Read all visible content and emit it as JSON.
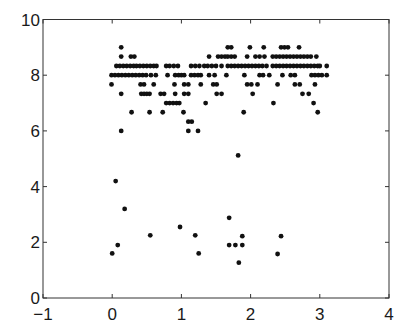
{
  "chart_data": {
    "type": "scatter",
    "title": "",
    "xlabel": "",
    "ylabel": "",
    "xlim": [
      -1,
      4
    ],
    "ylim": [
      0,
      10
    ],
    "xticks": [
      -1,
      0,
      1,
      2,
      3,
      4
    ],
    "yticks": [
      0,
      2,
      4,
      6,
      8,
      10
    ],
    "grid": false,
    "legend": null,
    "marker_color": "#111111",
    "series": [
      {
        "name": "points",
        "points": [
          [
            0.13,
            9.0
          ],
          [
            1.67,
            9.0
          ],
          [
            1.72,
            9.0
          ],
          [
            1.99,
            9.0
          ],
          [
            2.19,
            9.0
          ],
          [
            2.44,
            9.0
          ],
          [
            2.49,
            9.0
          ],
          [
            2.54,
            9.0
          ],
          [
            2.7,
            9.0
          ],
          [
            0.13,
            8.67
          ],
          [
            0.27,
            8.67
          ],
          [
            0.32,
            8.67
          ],
          [
            1.4,
            8.67
          ],
          [
            1.53,
            8.67
          ],
          [
            1.58,
            8.67
          ],
          [
            1.63,
            8.67
          ],
          [
            1.67,
            8.67
          ],
          [
            1.72,
            8.67
          ],
          [
            1.77,
            8.67
          ],
          [
            1.95,
            8.67
          ],
          [
            2.07,
            8.67
          ],
          [
            2.13,
            8.67
          ],
          [
            2.2,
            8.67
          ],
          [
            2.32,
            8.67
          ],
          [
            2.37,
            8.67
          ],
          [
            2.42,
            8.67
          ],
          [
            2.47,
            8.67
          ],
          [
            2.52,
            8.67
          ],
          [
            2.57,
            8.67
          ],
          [
            2.62,
            8.67
          ],
          [
            2.67,
            8.67
          ],
          [
            2.72,
            8.67
          ],
          [
            2.77,
            8.67
          ],
          [
            2.82,
            8.67
          ],
          [
            2.87,
            8.67
          ],
          [
            2.95,
            8.67
          ],
          [
            0.06,
            8.33
          ],
          [
            0.11,
            8.33
          ],
          [
            0.16,
            8.33
          ],
          [
            0.21,
            8.33
          ],
          [
            0.26,
            8.33
          ],
          [
            0.31,
            8.33
          ],
          [
            0.35,
            8.33
          ],
          [
            0.4,
            8.33
          ],
          [
            0.45,
            8.33
          ],
          [
            0.5,
            8.33
          ],
          [
            0.55,
            8.33
          ],
          [
            0.6,
            8.33
          ],
          [
            0.64,
            8.33
          ],
          [
            0.78,
            8.33
          ],
          [
            0.83,
            8.33
          ],
          [
            0.89,
            8.33
          ],
          [
            0.95,
            8.33
          ],
          [
            1.14,
            8.33
          ],
          [
            1.2,
            8.33
          ],
          [
            1.26,
            8.33
          ],
          [
            1.33,
            8.33
          ],
          [
            1.38,
            8.33
          ],
          [
            1.44,
            8.33
          ],
          [
            1.5,
            8.33
          ],
          [
            1.58,
            8.33
          ],
          [
            1.67,
            8.33
          ],
          [
            1.72,
            8.33
          ],
          [
            1.77,
            8.33
          ],
          [
            1.82,
            8.33
          ],
          [
            1.87,
            8.33
          ],
          [
            1.92,
            8.33
          ],
          [
            1.97,
            8.33
          ],
          [
            2.02,
            8.33
          ],
          [
            2.07,
            8.33
          ],
          [
            2.12,
            8.33
          ],
          [
            2.17,
            8.33
          ],
          [
            2.23,
            8.33
          ],
          [
            2.32,
            8.33
          ],
          [
            2.37,
            8.33
          ],
          [
            2.42,
            8.33
          ],
          [
            2.47,
            8.33
          ],
          [
            2.52,
            8.33
          ],
          [
            2.57,
            8.33
          ],
          [
            2.62,
            8.33
          ],
          [
            2.67,
            8.33
          ],
          [
            2.72,
            8.33
          ],
          [
            2.77,
            8.33
          ],
          [
            2.82,
            8.33
          ],
          [
            2.87,
            8.33
          ],
          [
            2.92,
            8.33
          ],
          [
            2.97,
            8.33
          ],
          [
            3.0,
            8.33
          ],
          [
            3.1,
            8.33
          ],
          [
            -0.01,
            8.0
          ],
          [
            0.04,
            8.0
          ],
          [
            0.09,
            8.0
          ],
          [
            0.14,
            8.0
          ],
          [
            0.19,
            8.0
          ],
          [
            0.24,
            8.0
          ],
          [
            0.29,
            8.0
          ],
          [
            0.34,
            8.0
          ],
          [
            0.39,
            8.0
          ],
          [
            0.44,
            8.0
          ],
          [
            0.49,
            8.0
          ],
          [
            0.56,
            8.0
          ],
          [
            0.63,
            8.0
          ],
          [
            0.8,
            8.0
          ],
          [
            0.91,
            8.0
          ],
          [
            0.96,
            8.0
          ],
          [
            1.0,
            8.0
          ],
          [
            1.04,
            8.0
          ],
          [
            1.14,
            8.0
          ],
          [
            1.19,
            8.0
          ],
          [
            1.24,
            8.0
          ],
          [
            1.28,
            8.0
          ],
          [
            1.4,
            8.0
          ],
          [
            1.48,
            8.0
          ],
          [
            1.65,
            8.0
          ],
          [
            1.91,
            8.0
          ],
          [
            2.13,
            8.0
          ],
          [
            2.18,
            8.0
          ],
          [
            2.27,
            8.0
          ],
          [
            2.46,
            8.0
          ],
          [
            2.58,
            8.0
          ],
          [
            2.64,
            8.0
          ],
          [
            2.88,
            8.0
          ],
          [
            2.93,
            8.0
          ],
          [
            2.98,
            8.0
          ],
          [
            3.03,
            8.0
          ],
          [
            3.1,
            8.0
          ],
          [
            -0.01,
            7.67
          ],
          [
            0.41,
            7.67
          ],
          [
            0.46,
            7.67
          ],
          [
            0.6,
            7.67
          ],
          [
            0.9,
            7.67
          ],
          [
            1.04,
            7.67
          ],
          [
            1.1,
            7.67
          ],
          [
            1.28,
            7.67
          ],
          [
            1.46,
            7.67
          ],
          [
            1.51,
            7.67
          ],
          [
            1.95,
            7.67
          ],
          [
            2.01,
            7.67
          ],
          [
            2.1,
            7.67
          ],
          [
            2.39,
            7.67
          ],
          [
            2.64,
            7.67
          ],
          [
            2.71,
            7.67
          ],
          [
            2.93,
            7.67
          ],
          [
            0.13,
            7.33
          ],
          [
            0.42,
            7.33
          ],
          [
            0.46,
            7.33
          ],
          [
            0.5,
            7.33
          ],
          [
            0.54,
            7.33
          ],
          [
            0.7,
            7.33
          ],
          [
            0.75,
            7.33
          ],
          [
            0.91,
            7.33
          ],
          [
            1.04,
            7.33
          ],
          [
            1.1,
            7.33
          ],
          [
            1.51,
            7.33
          ],
          [
            1.58,
            7.33
          ],
          [
            2.03,
            7.33
          ],
          [
            2.75,
            7.33
          ],
          [
            2.84,
            7.33
          ],
          [
            0.78,
            7.0
          ],
          [
            0.83,
            7.0
          ],
          [
            0.88,
            7.0
          ],
          [
            0.93,
            7.0
          ],
          [
            0.97,
            7.0
          ],
          [
            1.35,
            7.0
          ],
          [
            2.33,
            7.0
          ],
          [
            2.91,
            7.0
          ],
          [
            0.28,
            6.67
          ],
          [
            0.54,
            6.67
          ],
          [
            0.73,
            6.67
          ],
          [
            1.03,
            6.67
          ],
          [
            1.9,
            6.67
          ],
          [
            2.97,
            6.67
          ],
          [
            1.1,
            6.33
          ],
          [
            1.15,
            6.33
          ],
          [
            0.13,
            6.0
          ],
          [
            1.1,
            6.0
          ],
          [
            1.24,
            6.0
          ],
          [
            1.82,
            5.12
          ],
          [
            0.05,
            4.2
          ],
          [
            0.18,
            3.2
          ],
          [
            1.69,
            2.88
          ],
          [
            0.98,
            2.55
          ],
          [
            0.55,
            2.25
          ],
          [
            1.2,
            2.25
          ],
          [
            1.88,
            2.22
          ],
          [
            2.44,
            2.22
          ],
          [
            0.08,
            1.9
          ],
          [
            1.69,
            1.9
          ],
          [
            1.78,
            1.9
          ],
          [
            1.88,
            1.9
          ],
          [
            0.0,
            1.6
          ],
          [
            1.25,
            1.6
          ],
          [
            2.39,
            1.58
          ],
          [
            1.83,
            1.27
          ]
        ]
      }
    ]
  }
}
